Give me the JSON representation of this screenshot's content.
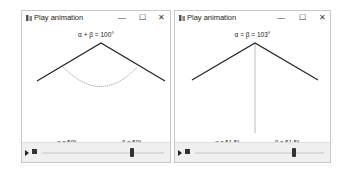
{
  "windows": [
    {
      "title": "Play animation",
      "buttons": {
        "minimize": "—",
        "maximize": "☐",
        "close": "✕"
      },
      "sum_label": "α + β = 100°",
      "alpha_label": "α = 50°",
      "beta_label": "β = 50°",
      "slider": {
        "position_pct": 72
      },
      "icons": {
        "app": "app-icon",
        "play": "play-icon",
        "stop": "stop-icon"
      }
    },
    {
      "title": "Play animation",
      "buttons": {
        "minimize": "—",
        "maximize": "☐",
        "close": "✕"
      },
      "sum_label": "α = β = 103°",
      "alpha_label": "α = 51.5°",
      "beta_label": "β = 51.5°",
      "slider": {
        "position_pct": 75
      },
      "icons": {
        "app": "app-icon",
        "play": "play-icon",
        "stop": "stop-icon"
      }
    }
  ],
  "colors": {
    "line": "#222222",
    "arc": "#888888",
    "vertical": "#aaaaaa",
    "controls_bg": "#f0f0f0"
  }
}
